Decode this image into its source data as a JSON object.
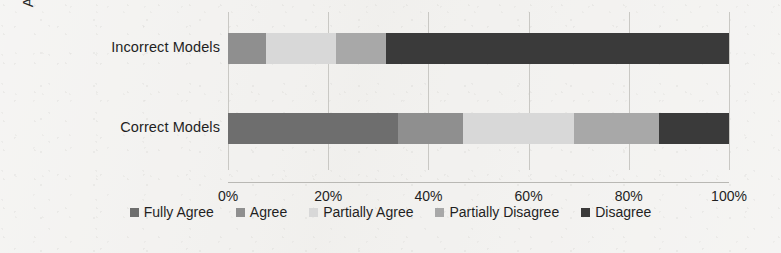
{
  "chart_data": {
    "type": "bar",
    "orientation": "horizontal",
    "stacked": true,
    "stack_mode": "percent",
    "title": "",
    "xlabel": "",
    "ylabel": "Acceptance of",
    "categories": [
      "Incorrect Models",
      "Correct Models"
    ],
    "series": [
      {
        "name": "Fully Agree",
        "color": "#6e6e6e",
        "values": [
          0,
          34
        ]
      },
      {
        "name": "Agree",
        "color": "#8f8f8f",
        "values": [
          7.5,
          13
        ]
      },
      {
        "name": "Partially Agree",
        "color": "#d8d8d8",
        "values": [
          14,
          22
        ]
      },
      {
        "name": "Partially Disagree",
        "color": "#a8a8a8",
        "values": [
          10,
          17
        ]
      },
      {
        "name": "Disagree",
        "color": "#3a3a3a",
        "values": [
          68.5,
          14
        ]
      }
    ],
    "xlim": [
      0,
      100
    ],
    "xticks": [
      0,
      20,
      40,
      60,
      80,
      100
    ],
    "xticklabels": [
      "0%",
      "20%",
      "40%",
      "60%",
      "80%",
      "100%"
    ],
    "grid": true,
    "grid_axis": "x",
    "legend_position": "bottom"
  },
  "axis": {
    "y_title": "Acceptance of"
  },
  "colors": {
    "background": "#f2f1ef",
    "gridline": "#c9c8c4",
    "text": "#1f1f1f"
  }
}
